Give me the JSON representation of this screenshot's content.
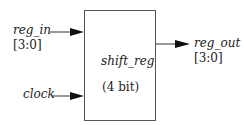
{
  "block": {
    "name": "shift_reg",
    "width_label": "(4 bit)"
  },
  "inputs": [
    {
      "name": "reg_in",
      "bus": "[3:0]"
    },
    {
      "name": "clock"
    }
  ],
  "outputs": [
    {
      "name": "reg_out",
      "bus": "[3:0]"
    }
  ],
  "colors": {
    "line": "#333333",
    "text": "#222222"
  }
}
